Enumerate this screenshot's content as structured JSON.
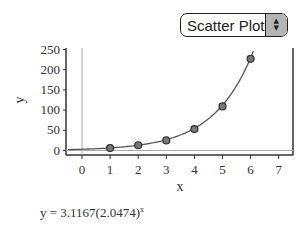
{
  "plot_type_select": {
    "selected": "Scatter Plot",
    "arrow_up": "▲",
    "arrow_down": "▼"
  },
  "equation": {
    "prefix": "y = 3.1167(2.0474)",
    "exponent": "x"
  },
  "chart_data": {
    "type": "scatter",
    "title": "",
    "xlabel": "x",
    "ylabel": "y",
    "xlim": [
      -0.5,
      7.5
    ],
    "ylim": [
      -10,
      255
    ],
    "x_ticks": [
      0,
      1,
      2,
      3,
      4,
      5,
      6,
      7
    ],
    "y_ticks": [
      0,
      50,
      100,
      150,
      200,
      250
    ],
    "grid": false,
    "legend": null,
    "series": [
      {
        "name": "data",
        "x": [
          1,
          2,
          3,
          4,
          5,
          6
        ],
        "y": [
          6,
          13,
          25,
          53,
          109,
          227
        ]
      }
    ],
    "fit": {
      "type": "exponential",
      "equation": "y = 3.1167(2.0474)^x",
      "a": 3.1167,
      "b": 2.0474,
      "x_range": [
        -0.5,
        6.1
      ]
    }
  }
}
